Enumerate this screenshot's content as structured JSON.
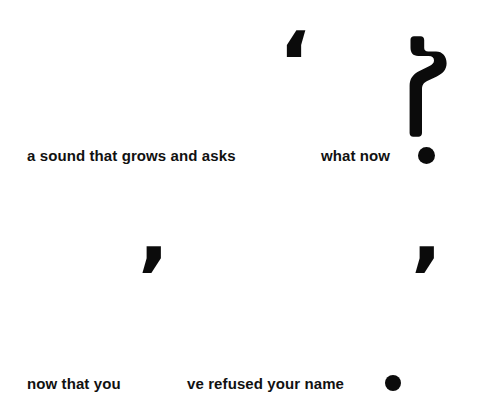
{
  "page": {
    "background_color": "#ffffff",
    "ink_color": "#0b0b0b",
    "width": 502,
    "height": 400
  },
  "composition": {
    "title": "typographic punctuation composition",
    "lines": [
      {
        "id": "line-1",
        "segments": [
          {
            "name": "a-sound-that-grows-and-asks",
            "text": "a sound that grows and asks"
          },
          {
            "name": "what-now",
            "text": "what now"
          }
        ],
        "terminator": "●"
      },
      {
        "id": "line-2",
        "segments": [
          {
            "name": "now-that-you",
            "text": "now that you"
          },
          {
            "name": "ve-refused-your-name",
            "text": "ve refused your name"
          }
        ],
        "terminator": "●"
      }
    ]
  },
  "text": {
    "line1_left": "a sound that grows and asks",
    "line1_right": "what now",
    "line2_left": "now that you",
    "line2_right": "ve refused your name"
  },
  "glyphs": {
    "open_quote": "‘",
    "apostrophe_left": "’",
    "apostrophe_right": "’",
    "question_mark": "?",
    "period_dot": "●"
  }
}
